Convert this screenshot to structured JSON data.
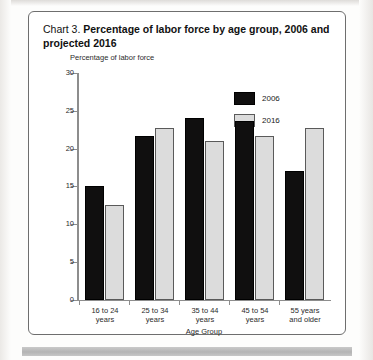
{
  "figure": {
    "title_lead": "Chart 3. ",
    "title_strong": "Percentage of labor force by age group, 2006 and projected 2016"
  },
  "legend": {
    "position": "top-right",
    "items": [
      {
        "label": "2006",
        "color": "#100f0f"
      },
      {
        "label": "2016",
        "color": "#dcdcdc"
      }
    ]
  },
  "axes": {
    "y_title": "Percentage of labor force",
    "x_title": "Age Group",
    "y_ticks": [
      "30",
      "25",
      "20",
      "15",
      "10",
      "5",
      "0"
    ]
  },
  "chart_data": {
    "type": "bar",
    "title": "Chart 3. Percentage of labor force by age group, 2006 and projected 2016",
    "xlabel": "Age Group",
    "ylabel": "Percentage of labor force",
    "ylim": [
      0,
      30
    ],
    "ytick_step": 5,
    "grid": false,
    "legend_position": "top-right",
    "categories": [
      "16 to 24 years",
      "25 to 34 years",
      "35 to 44 years",
      "45 to 54 years",
      "55 years and older"
    ],
    "category_lines": [
      [
        "16 to 24",
        "years"
      ],
      [
        "25 to 34",
        "years"
      ],
      [
        "35 to 44",
        "years"
      ],
      [
        "45 to 54",
        "years"
      ],
      [
        "55 years",
        "and older"
      ]
    ],
    "series": [
      {
        "name": "2006",
        "color": "#100f0f",
        "values": [
          15.0,
          21.6,
          24.1,
          23.7,
          17.0
        ]
      },
      {
        "name": "2016",
        "color": "#dcdcdc",
        "values": [
          12.5,
          22.7,
          21.0,
          21.7,
          22.7
        ]
      }
    ]
  }
}
